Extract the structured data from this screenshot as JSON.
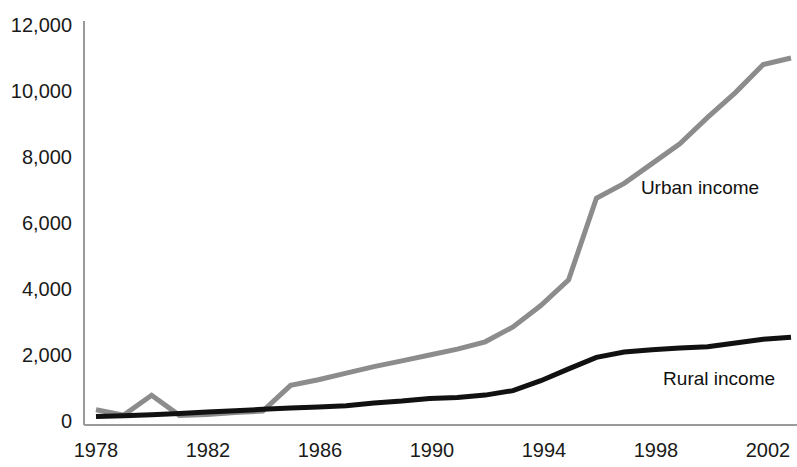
{
  "chart_data": {
    "type": "line",
    "title": "",
    "xlabel": "",
    "ylabel": "",
    "xlim": [
      1978,
      2003
    ],
    "ylim": [
      0,
      12000
    ],
    "grid": false,
    "legend_position": "inline-annotation",
    "x": [
      1978,
      1979,
      1980,
      1981,
      1982,
      1983,
      1984,
      1985,
      1986,
      1987,
      1988,
      1989,
      1990,
      1991,
      1992,
      1993,
      1994,
      1995,
      1996,
      1997,
      1998,
      1999,
      2000,
      2001,
      2002,
      2003
    ],
    "xticks": [
      "1978",
      "1982",
      "1986",
      "1990",
      "1994",
      "1998",
      "2002"
    ],
    "xtick_values": [
      1978,
      1982,
      1986,
      1990,
      1994,
      1998,
      2002
    ],
    "yticks": [
      "0",
      "2,000",
      "4,000",
      "6,000",
      "8,000",
      "10,000",
      "12,000"
    ],
    "ytick_values": [
      0,
      2000,
      4000,
      6000,
      8000,
      10000,
      12000
    ],
    "series": [
      {
        "name": "Urban income",
        "color": "#8c8c8c",
        "width": 5,
        "label_x": 1997.6,
        "label_y": 7050,
        "values": [
          340,
          180,
          780,
          170,
          200,
          260,
          300,
          1080,
          1250,
          1450,
          1650,
          1820,
          2000,
          2180,
          2400,
          2850,
          3500,
          4280,
          6750,
          7200,
          7800,
          8400,
          9200,
          9950,
          10800,
          11000
        ]
      },
      {
        "name": "Rural income",
        "color": "#111111",
        "width": 5,
        "label_x": 1998.4,
        "label_y": 1260,
        "values": [
          134,
          160,
          191,
          223,
          270,
          310,
          355,
          398,
          424,
          463,
          545,
          602,
          686,
          709,
          784,
          922,
          1221,
          1578,
          1926,
          2090,
          2162,
          2210,
          2253,
          2366,
          2476,
          2540
        ]
      }
    ]
  },
  "axis": {
    "y_axis_line_color": "#9a9a9a",
    "x_axis_line_color": "#9a9a9a"
  }
}
